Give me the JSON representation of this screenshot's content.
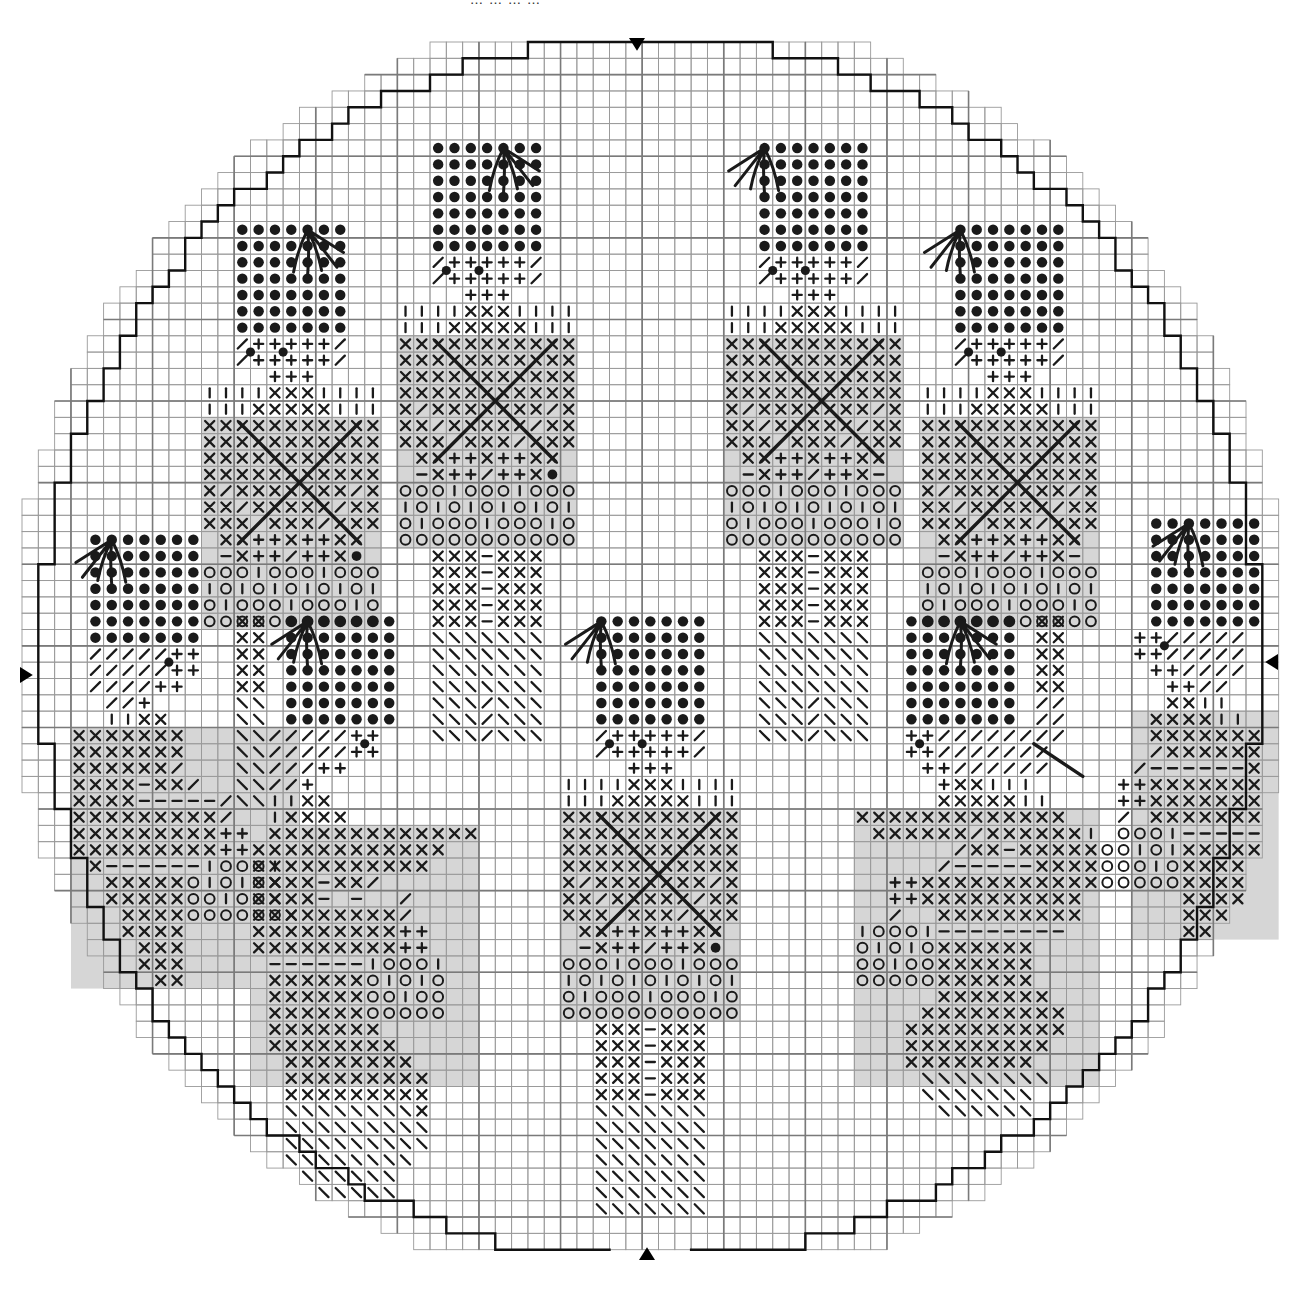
{
  "header": {
    "cropped_title": "…………"
  },
  "chart": {
    "type": "cross-stitch-pattern",
    "cell": 16.32,
    "origin": [
      22,
      42
    ],
    "cols": 78,
    "rows": 74,
    "bold_every": 5,
    "center": [
      38.5,
      37.2
    ],
    "radius": 37.4,
    "colors": {
      "grid": "#9a9a9a",
      "grid_bold": "#7a7a7a",
      "outline": "#111111",
      "symbol": "#1a1a1a",
      "shade": "#d6d6d6",
      "paper": "#ffffff"
    },
    "markers": [
      {
        "name": "top-center-marker",
        "dir": "down",
        "x": 637,
        "y": 46
      },
      {
        "name": "bottom-center-marker",
        "dir": "up",
        "x": 647,
        "y": 1252
      },
      {
        "name": "left-center-marker",
        "dir": "right",
        "x": 28,
        "y": 675
      },
      {
        "name": "right-center-marker",
        "dir": "left",
        "x": 1270,
        "y": 662
      }
    ],
    "legend_symbols": {
      "o": "french-knot-dot",
      "x": "cross",
      "+": "plus",
      "/": "slash",
      "\\": "backslash",
      "|": "vertical",
      "-": "dash",
      "O": "circle",
      "*": "small-dot"
    },
    "figures": [
      {
        "name": "soldier-upper-left",
        "col": 11,
        "row": 11,
        "rows": [
          "  ooooooo  ",
          "  ooooooo  ",
          "  ooooooo  ",
          "  ooooooo  ",
          "  ooooooo  ",
          "  ooooooo  ",
          "  ooooooo  ",
          "  /+++++/  ",
          "  /+++++/  ",
          "    +++    ",
          "||||xxx||||",
          "|||xxxxx|||",
          "xxxxxxxxxxx",
          "xxxxxxxxxxx",
          "xxxxxxxxxxx",
          "xxxxxxxxxxx",
          "x/xxxxxxx/x",
          "xx/xxxxx/xx",
          "xxx/xxx/xxx",
          " xx++x++xx ",
          " -x++/++x* ",
          "OOO|OOO|OOO",
          "|O|O|O|O|O|",
          "O|OOO|OOO|O",
          "OOOOOOOOOOO"
        ],
        "shade": [
          [
            0,
            12,
            11,
            13
          ]
        ],
        "dots_on": [
          [
            3,
            8
          ],
          [
            5,
            8
          ]
        ],
        "tassel": [
          6,
          0
        ],
        "big_x": [
          [
            2,
            12
          ],
          [
            9,
            19
          ]
        ]
      },
      {
        "name": "soldier-upper-mid-left",
        "col": 23,
        "row": 6,
        "rows": [
          "  ooooooo  ",
          "  ooooooo  ",
          "  ooooooo  ",
          "  ooooooo  ",
          "  ooooooo  ",
          "  ooooooo  ",
          "  ooooooo  ",
          "  /+++++/  ",
          "  /+++++/  ",
          "    +++    ",
          "||||xxx||||",
          "|||xxxxx|||",
          "xxxxxxxxxxx",
          "xxxxxxxxxxx",
          "xxxxxxxxxxx",
          "xxxxxxxxxxx",
          "x/xxxxxxx/x",
          "xx/xxxxx/xx",
          "xxx/xxx/xxx",
          " xx++x++xx ",
          " -x++/++x* ",
          "OOO|OOO|OOO",
          "|O|O|O|O|O|",
          "O|OOO|OOO|O",
          "OOOOOOOOOOO",
          "  xxx-xxx  ",
          "  xxx-xxx  ",
          "  xxx-xxx  ",
          "  xxx-xxx  ",
          "  xxx-xxx  ",
          "  \\\\\\\\\\\\\\  ",
          "  \\\\\\\\\\\\\\  ",
          "  \\\\\\\\\\\\\\  ",
          "  \\\\\\\\\\\\\\  ",
          "  \\\\\\/\\\\\\  ",
          "  \\\\\\/\\\\\\  ",
          "  \\\\\\/\\\\\\  "
        ],
        "shade": [
          [
            0,
            12,
            11,
            13
          ]
        ],
        "dots_on": [
          [
            3,
            8
          ],
          [
            5,
            8
          ]
        ],
        "tassel": [
          6,
          0
        ],
        "big_x": [
          [
            2,
            12
          ],
          [
            9,
            19
          ]
        ]
      },
      {
        "name": "soldier-upper-mid-right",
        "col": 43,
        "row": 6,
        "rows": [
          "  ooooooo  ",
          "  ooooooo  ",
          "  ooooooo  ",
          "  ooooooo  ",
          "  ooooooo  ",
          "  ooooooo  ",
          "  ooooooo  ",
          "  /+++++/  ",
          "  /+++++/  ",
          "    +++    ",
          "||||xxx||||",
          "|||xxxxx|||",
          "xxxxxxxxxxx",
          "xxxxxxxxxxx",
          "xxxxxxxxxxx",
          "xxxxxxxxxxx",
          "x/xxxxxxx/x",
          "xx/xxxxx/xx",
          "xxx/xxx/xxx",
          " xx++x++xx ",
          " -x++/++x- ",
          "OOO|OOO|OOO",
          "|O|O|O|O|O|",
          "O|OOO|OOO|O",
          "OOOOOOOOOOO",
          "  xxx-xxx  ",
          "  xxx-xxx  ",
          "  xxx-xxx  ",
          "  xxx-xxx  ",
          "  xxx-xxx  ",
          "  \\\\\\\\\\\\\\  ",
          "  \\\\\\\\\\\\\\  ",
          "  \\\\\\\\\\\\\\  ",
          "  \\\\\\\\\\\\\\  ",
          "  \\\\\\/\\\\\\  ",
          "  \\\\\\/\\\\\\  ",
          "  \\\\\\/\\\\\\  "
        ],
        "shade": [
          [
            0,
            12,
            11,
            13
          ]
        ],
        "dots_on": [
          [
            3,
            8
          ],
          [
            5,
            8
          ]
        ],
        "tassel": [
          2,
          0
        ],
        "big_x": [
          [
            2,
            12
          ],
          [
            9,
            19
          ]
        ]
      },
      {
        "name": "soldier-upper-right",
        "col": 55,
        "row": 11,
        "rows": [
          "  ooooooo  ",
          "  ooooooo  ",
          "  ooooooo  ",
          "  ooooooo  ",
          "  ooooooo  ",
          "  ooooooo  ",
          "  ooooooo  ",
          "  /+++++/  ",
          "  /+++++/  ",
          "    +++    ",
          "||||xxx||||",
          "|||xxxxx|||",
          "xxxxxxxxxxx",
          "xxxxxxxxxxx",
          "xxxxxxxxxxx",
          "xxxxxxxxxxx",
          "x/xxxxxxx/x",
          "xx/xxxxx/xx",
          "xxx/xxx/xxx",
          " xx++x++xx ",
          " -x++/++x- ",
          "OOO|OOO|OOO",
          "|O|O|O|O|O|",
          "O|OOO|OOO|O",
          "OOOOOOOOOOO"
        ],
        "shade": [
          [
            0,
            12,
            11,
            13
          ]
        ],
        "dots_on": [
          [
            3,
            8
          ],
          [
            5,
            8
          ]
        ],
        "tassel": [
          2,
          0
        ],
        "big_x": [
          [
            2,
            12
          ],
          [
            9,
            19
          ]
        ]
      },
      {
        "name": "soldier-center",
        "col": 33,
        "row": 35,
        "rows": [
          "  ooooooo  ",
          "  ooooooo  ",
          "  ooooooo  ",
          "  ooooooo  ",
          "  ooooooo  ",
          "  ooooooo  ",
          "  ooooooo  ",
          "  /+++++/  ",
          "  /+++++/  ",
          "    +++    ",
          "||||xxx||||",
          "|||xxxxx|||",
          "xxxxxxxxxxx",
          "xxxxxxxxxxx",
          "xxxxxxxxxxx",
          "xxxxxxxxxxx",
          "x/xxxxxxx/x",
          "xx/xxxxx/xx",
          "xxx/xxx/xxx",
          " xx++x++xx ",
          " -x++/++x* ",
          "OOO|OOO|OOO",
          "|O|O|O|O|O|",
          "O|OOO|OOO|O",
          "OOOOOOOOOOO",
          "  xxx-xxx  ",
          "  xxx-xxx  ",
          "  xxx-xxx  ",
          "  xxx-xxx  ",
          "  xxx-xxx  ",
          "  \\\\\\\\\\\\\\  ",
          "  \\\\\\\\\\\\\\  ",
          "  \\\\\\\\\\\\\\  ",
          "  \\\\\\\\\\\\\\  ",
          "  \\\\\\\\\\\\\\  ",
          "  \\\\\\\\\\\\\\  ",
          "  \\\\\\\\\\\\\\  "
        ],
        "shade": [
          [
            0,
            12,
            11,
            13
          ]
        ],
        "dots_on": [
          [
            3,
            8
          ],
          [
            5,
            8
          ]
        ],
        "tassel": [
          2,
          0
        ],
        "big_x": [
          [
            2,
            12
          ],
          [
            9,
            19
          ]
        ]
      },
      {
        "name": "kneeling-figure-left",
        "col": 2,
        "row": 30,
        "rows": [
          "  ooooooo      ",
          "  ooooooo      ",
          "  ooooooo      ",
          "  ooooooo      ",
          "  ooooooo      ",
          "  ooooooo      ",
          "  ooooooo      ",
          "  /////++      ",
          "  /////++      ",
          "  ////++       ",
          "   //+         ",
          "   ||xx        ",
          " xxxxxxx       ",
          " xxxxxxx       ",
          " xxxxxx/       ",
          " xxxx-xx/      ",
          " xxxx-----/    ",
          " xxxxxxxxx/    ",
          " xxxxxxxxx++   ",
          " xxxxxxxxx++   ",
          "  x------|OOO| ",
          "   xxxxxO|O|Ox ",
          "   xxxxxOO|OOx ",
          "    xxxxOOOOOOx",
          "    xxxx       ",
          "     xxx       ",
          "     xxx       ",
          "      xx       "
        ],
        "shade": [
          [
            1,
            12,
            14,
            16
          ]
        ],
        "dots_on": [
          [
            7,
            8
          ]
        ],
        "tassel": [
          3,
          0
        ]
      },
      {
        "name": "kneeling-figure-mid-left",
        "col": 13,
        "row": 35,
        "rows": [
          "xx ooooooo  ",
          "xx ooooooo  ",
          "xx ooooooo  ",
          "xx ooooooo  ",
          "xx ooooooo  ",
          "\\\\ ooooooo  ",
          "\\\\ ooooooo  ",
          "\\\\/////++   ",
          "\\\\/////++   ",
          "\\\\///++     ",
          "\\\\//+       ",
          "\\\\||xx      ",
          "  |xxxx     ",
          "  xxxxxxxxxxxxx",
          " xxxxxxxxxxxx",
          " xxxxxxxxxxx",
          " xxxx-xx/   ",
          " xxxx- -  / ",
          " xxxxxxxxx/ ",
          " xxxxxxxxx++",
          " xxxxxxxxx++",
          "  ------|OOO|",
          "  xxxxxxO|O|O",
          "  xxxxxxOO|OO",
          "  xxxxxxOOOOO",
          "  xxxxxxx    ",
          "  xxxxxxxx   ",
          "   xxxxxxxx  ",
          "   xxxxxxxxx ",
          "   xxxxxxxxx ",
          "   \\\\\\\\\\\\\\\\x ",
          "   \\\\\\\\\\\\\\\\\\ ",
          "   \\\\\\\\\\\\\\\\\\ ",
          "   \\\\\\\\\\\\\\\\  ",
          "    \\\\\\\\\\\\   ",
          "     \\\\\\\\\\   "
        ],
        "shade": [
          [
            1,
            13,
            14,
            16
          ]
        ],
        "dots_on": [
          [
            8,
            8
          ]
        ],
        "tassel": [
          4,
          0
        ]
      },
      {
        "name": "kneeling-figure-mid-right",
        "col": 51,
        "row": 35,
        "rows": [
          "   ooooooo xx",
          "   ooooooo xx",
          "   ooooooo xx",
          "   ooooooo xx",
          "   ooooooo xx",
          "   ooooooo //",
          "   ooooooo //",
          "   ++////////",
          "   ++///////",
          "    ++//////",
          "     +xx|||",
          "     xxxxx||",
          "xxxxxxxxxxxxx",
          " xxxxxx/xxxxxx|",
          "      /xx-xxxxxO",
          "     /-----xxxxO",
          "  ++xxxxxxxxxxxO",
          "  ++xxxxxxxxxx",
          "  /  xxxxxxxxx",
          "|OOO|--------",
          "O|O|Oxxxxxx",
          "OO|OOxxxxxx",
          "OOOOOxxxxxx",
          "     xxxxxxx",
          "    xxxxxxxxx",
          "   xxxxxxxxxx",
          "   xxxxxxxxx",
          "   xxxxxxxx",
          "    \\\\\\\\\\\\\\\\",
          "    \\\\\\\\\\\\\\",
          "     \\\\\\\\\\\\"
        ],
        "shade": [
          [
            0,
            12,
            15,
            17
          ]
        ],
        "dots_on": [
          [
            4,
            8
          ]
        ],
        "tassel": [
          6,
          0
        ]
      },
      {
        "name": "kneeling-figure-right",
        "col": 67,
        "row": 29,
        "rows": [
          "  ooooooo",
          "  ooooooo",
          "  ooooooo",
          "  ooooooo",
          "  ooooooo",
          "  ooooooo",
          "  ooooooo",
          " ++/////",
          " ++/////",
          "  ++////",
          "   ++// ",
          "   xx|| ",
          "  xxxx|| ",
          "  xxxxxxx",
          "  /xxxxxx",
          " /------x",
          "++xxxxxxx",
          "++xxxxxxx",
          "/ xxxxxxx",
          "OOO|-----",
          "O|O|xxxxx",
          "OO|Oxxxx ",
          "OOOOxxxx ",
          "    xxxx ",
          "    xxx  ",
          "    xx   "
        ],
        "shade": [
          [
            1,
            12,
            9,
            14
          ]
        ],
        "dots_on": [
          [
            3,
            8
          ]
        ],
        "tassel": [
          4,
          0
        ]
      }
    ],
    "backstitch_lines": [
      [
        [
          62,
          43
        ],
        [
          65,
          45
        ]
      ]
    ]
  }
}
